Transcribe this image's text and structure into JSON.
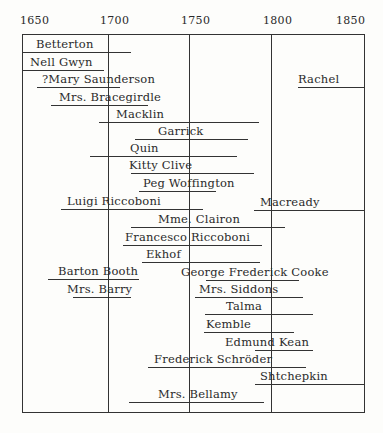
{
  "chart_data": {
    "type": "timeline",
    "title": "",
    "xlabel": "",
    "ylabel": "",
    "xlim": [
      1650,
      1850
    ],
    "grid": true,
    "ticks": [
      "1650",
      "1700",
      "1750",
      "1800",
      "1850"
    ],
    "tick_px": [
      22,
      108,
      189,
      271,
      364
    ],
    "frame": {
      "left": 22,
      "top": 34,
      "right": 364,
      "bottom": 412
    },
    "series": [
      {
        "name": "Betterton",
        "start": 1650,
        "end": 1715,
        "y": 52,
        "x1": 22,
        "x2": 131,
        "label_x": 36
      },
      {
        "name": "Nell Gwyn",
        "start": 1650,
        "end": 1698,
        "y": 70,
        "x1": 22,
        "x2": 104,
        "label_x": 30
      },
      {
        "name": "?Mary Saunderson",
        "start": 1659,
        "end": 1707,
        "y": 87,
        "x1": 37,
        "x2": 120,
        "label_x": 42
      },
      {
        "name": "Rachel",
        "start": 1817,
        "end": 1850,
        "y": 87,
        "x1": 298,
        "x2": 364,
        "label_x": 298
      },
      {
        "name": "Mrs. Bracegirdle",
        "start": 1667,
        "end": 1724,
        "y": 105,
        "x1": 51,
        "x2": 148,
        "label_x": 59
      },
      {
        "name": "Macklin",
        "start": 1697,
        "end": 1792,
        "y": 122,
        "x1": 99,
        "x2": 259,
        "label_x": 116
      },
      {
        "name": "Garrick",
        "start": 1718,
        "end": 1784,
        "y": 139,
        "x1": 135,
        "x2": 248,
        "label_x": 158
      },
      {
        "name": "Quin",
        "start": 1691,
        "end": 1778,
        "y": 156,
        "x1": 90,
        "x2": 237,
        "label_x": 130
      },
      {
        "name": "Kitty Clive",
        "start": 1716,
        "end": 1789,
        "y": 173,
        "x1": 131,
        "x2": 254,
        "label_x": 129
      },
      {
        "name": "Peg Woffington",
        "start": 1720,
        "end": 1766,
        "y": 191,
        "x1": 139,
        "x2": 216,
        "label_x": 143
      },
      {
        "name": "Luigi Riccoboni",
        "start": 1673,
        "end": 1758,
        "y": 209,
        "x1": 61,
        "x2": 203,
        "label_x": 67
      },
      {
        "name": "Macready",
        "start": 1789,
        "end": 1850,
        "y": 210,
        "x1": 254,
        "x2": 364,
        "label_x": 260
      },
      {
        "name": "Mme. Clairon",
        "start": 1716,
        "end": 1808,
        "y": 227,
        "x1": 131,
        "x2": 285,
        "label_x": 158
      },
      {
        "name": "Francesco Riccoboni",
        "start": 1711,
        "end": 1794,
        "y": 245,
        "x1": 123,
        "x2": 262,
        "label_x": 125
      },
      {
        "name": "Ekhof",
        "start": 1722,
        "end": 1793,
        "y": 262,
        "x1": 142,
        "x2": 260,
        "label_x": 146
      },
      {
        "name": "Barton Booth",
        "start": 1663,
        "end": 1718,
        "y": 279,
        "x1": 48,
        "x2": 139,
        "label_x": 58
      },
      {
        "name": "George Frederick Cooke",
        "start": 1756,
        "end": 1812,
        "y": 280,
        "x1": 206,
        "x2": 299,
        "label_x": 181
      },
      {
        "name": "Mrs. Barry",
        "start": 1678,
        "end": 1713,
        "y": 297,
        "x1": 73,
        "x2": 131,
        "label_x": 67
      },
      {
        "name": "Mrs. Siddons",
        "start": 1755,
        "end": 1814,
        "y": 297,
        "x1": 195,
        "x2": 303,
        "label_x": 199
      },
      {
        "name": "Talma",
        "start": 1756,
        "end": 1820,
        "y": 314,
        "x1": 205,
        "x2": 313,
        "label_x": 226
      },
      {
        "name": "Kemble",
        "start": 1757,
        "end": 1810,
        "y": 332,
        "x1": 204,
        "x2": 294,
        "label_x": 206
      },
      {
        "name": "Edmund Kean",
        "start": 1787,
        "end": 1820,
        "y": 350,
        "x1": 255,
        "x2": 313,
        "label_x": 225
      },
      {
        "name": "Frederick Schröder",
        "start": 1744,
        "end": 1816,
        "y": 367,
        "x1": 148,
        "x2": 306,
        "label_x": 154
      },
      {
        "name": "Shtchepkin",
        "start": 1788,
        "end": 1850,
        "y": 384,
        "x1": 255,
        "x2": 364,
        "label_x": 260
      },
      {
        "name": "Mrs. Bellamy",
        "start": 1727,
        "end": 1788,
        "y": 402,
        "x1": 129,
        "x2": 264,
        "label_x": 158
      }
    ]
  }
}
